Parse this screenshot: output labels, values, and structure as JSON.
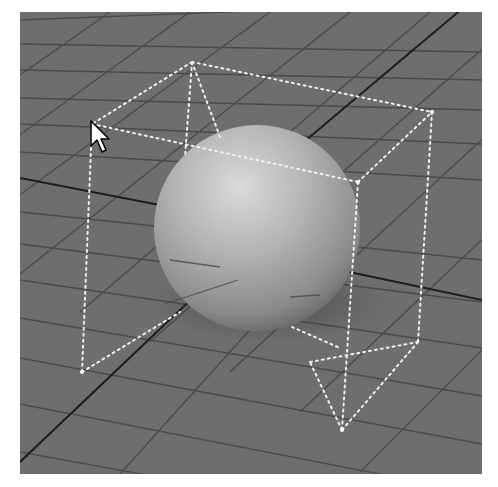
{
  "viewport": {
    "label": "3D perspective viewport",
    "background_color": "#6e6e6e",
    "grid": {
      "line_color": "#4a4a4a",
      "axis_color": "#1e1e1e",
      "visible": true
    },
    "object": {
      "type": "sphere",
      "selected": true,
      "highlight_color": "#d8d8d8",
      "shade_color": "#6a6a6a"
    },
    "bounding_box": {
      "style": "dotted",
      "color": "#f0f0f0"
    },
    "cursor": {
      "icon": "arrow-pointer-icon",
      "x": 70,
      "y": 108
    }
  }
}
